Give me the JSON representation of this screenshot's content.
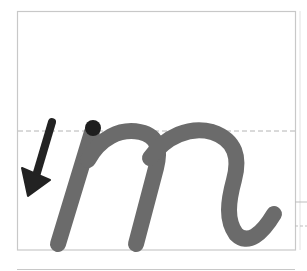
{
  "worksheet": {
    "letter": "m",
    "style": "cursive lowercase",
    "colors": {
      "background": "#ffffff",
      "frame": "#c8c8c8",
      "midline": "#b4b4b4",
      "letter": "#6b6b6b",
      "start_dot": "#1e1e1e",
      "arrow": "#222222"
    },
    "guides": {
      "frame": {
        "x": 17,
        "y": 11,
        "width": 278,
        "height": 239
      },
      "midline_y": 131,
      "baseline_y": 250,
      "bottom_rule_y": 269,
      "right_ticks_y": [
        202,
        226
      ]
    },
    "start_dot": {
      "cx": 93,
      "cy": 128,
      "r": 8
    },
    "direction_arrow": {
      "from": [
        52,
        122
      ],
      "to": [
        30,
        192
      ]
    }
  }
}
